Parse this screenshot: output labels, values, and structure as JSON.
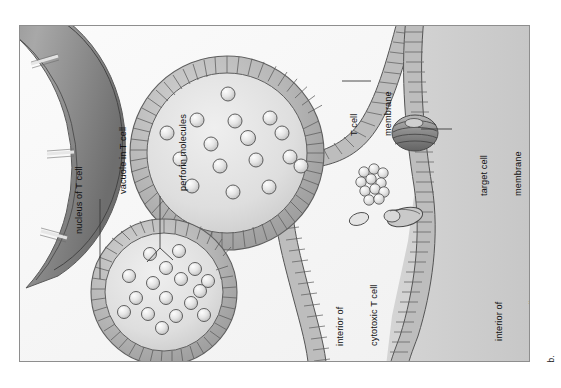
{
  "figure": {
    "panel_letter": "b.",
    "caption_subject": "perforin-mediated killing by a cytotoxic T cell",
    "labels": {
      "nucleus": "nucleus of T cell",
      "vacuole": "vacuole in T cell",
      "perforin": "perforin molecules",
      "t_cell_membrane_line1": "T cell",
      "t_cell_membrane_line2": "membrane",
      "target_cell_membrane_line1": "target cell",
      "target_cell_membrane_line2": "membrane",
      "interior_t_cell_line1": "interior of",
      "interior_t_cell_line2": "cytotoxic T cell",
      "interior_target_cell_line1": "interior of",
      "interior_target_cell_line2": "target cell"
    },
    "colors": {
      "frame_border": "#8e8e8e",
      "t_cell_interior": "#f7f7f7",
      "target_cell_interior": "#cfcfcf",
      "membrane_fill": "#bdbdbd",
      "membrane_stroke": "#5f5f5f",
      "vacuole_outer": "#b5b5b5",
      "vacuole_lumen": "#e3e3e3",
      "nucleus_fill": "#9a9a9a",
      "perforin_sphere": "#e8e8e8",
      "pore_complex": "#8a8a8a",
      "label_text": "#111111",
      "leader_line": "#3b3b3b"
    },
    "counts": {
      "perforin_in_large_vacuole": 16,
      "perforin_in_small_vacuole": 17,
      "pore_complexes_in_target_membrane": 2,
      "free_perforin_clusters": 1
    }
  }
}
